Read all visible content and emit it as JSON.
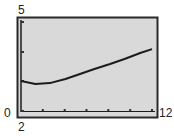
{
  "window": {
    "xmin_label": "2",
    "xmax_label": "12",
    "ymin_label": "0",
    "ymax_label": "5"
  },
  "colors": {
    "screen_bg": "#d9d9d9",
    "frame": "#2a2a2a",
    "curve": "#1c1c1c"
  },
  "chart_data": {
    "type": "line",
    "title": "",
    "xlabel": "",
    "ylabel": "",
    "xlim": [
      2,
      12
    ],
    "ylim": [
      0,
      5
    ],
    "grid": false,
    "legend": null,
    "x_ticks_count": 6,
    "series": [
      {
        "name": "curve",
        "x": [
          2.0,
          3.1,
          4.2,
          5.4,
          6.5,
          7.6,
          8.8,
          9.9,
          11.1,
          12.0
        ],
        "y": [
          1.69,
          1.52,
          1.57,
          1.8,
          2.08,
          2.36,
          2.64,
          2.92,
          3.26,
          3.48
        ]
      }
    ],
    "annotations": [
      "5",
      "0",
      "2",
      "12"
    ]
  }
}
